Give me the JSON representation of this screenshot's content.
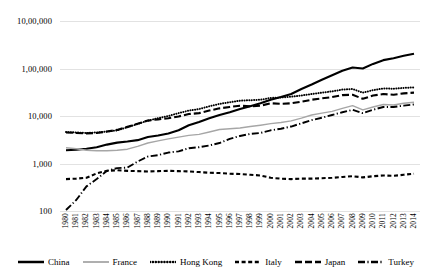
{
  "chart_data": {
    "type": "line",
    "title": "",
    "xlabel": "",
    "ylabel": "",
    "yscale": "log",
    "ylim": [
      100,
      1000000
    ],
    "grid": true,
    "legend_position": "bottom",
    "ytick_labels": [
      "100",
      "1,000",
      "10,000",
      "1,00,000",
      "10,00,000"
    ],
    "ytick_values": [
      100,
      1000,
      10000,
      100000,
      1000000
    ],
    "categories": [
      "1980",
      "1981",
      "1982",
      "1983",
      "1984",
      "1985",
      "1986",
      "1987",
      "1988",
      "1989",
      "1990",
      "1991",
      "1992",
      "1993",
      "1994",
      "1995",
      "1996",
      "1997",
      "1998",
      "1999",
      "2000",
      "2001",
      "2002",
      "2003",
      "2004",
      "2005",
      "2006",
      "2007",
      "2008",
      "2009",
      "2010",
      "2011",
      "2012",
      "2013",
      "2014"
    ],
    "series": [
      {
        "name": "China",
        "style": "solid",
        "color": "#000000",
        "width": 2.1,
        "values": [
          1900,
          1950,
          2050,
          2200,
          2500,
          2750,
          2900,
          3100,
          3600,
          3900,
          4300,
          5000,
          6400,
          7500,
          9000,
          10500,
          12000,
          14000,
          16000,
          18500,
          22000,
          25000,
          29000,
          37000,
          46000,
          58000,
          72000,
          90000,
          105000,
          100000,
          125000,
          150000,
          165000,
          185000,
          205000
        ]
      },
      {
        "name": "France",
        "style": "solid",
        "color": "#a6a6a6",
        "width": 1.4,
        "values": [
          2150,
          2050,
          1900,
          1850,
          1850,
          1900,
          2000,
          2300,
          2700,
          3000,
          3300,
          3600,
          3900,
          4100,
          4600,
          5200,
          5400,
          5600,
          6000,
          6400,
          6900,
          7300,
          7900,
          9000,
          10500,
          11500,
          12500,
          14500,
          16500,
          13500,
          15500,
          17500,
          17000,
          18500,
          19500
        ]
      },
      {
        "name": "Hong Kong",
        "style": "dotted",
        "color": "#000000",
        "width": 2.0,
        "values": [
          4600,
          4500,
          4400,
          4500,
          4700,
          5000,
          5800,
          6800,
          8000,
          9000,
          10000,
          11500,
          13000,
          14000,
          16000,
          18000,
          19500,
          21000,
          21500,
          22000,
          24000,
          24500,
          25500,
          27000,
          29000,
          31000,
          33000,
          36000,
          37000,
          31000,
          35000,
          38000,
          37500,
          39000,
          40000
        ]
      },
      {
        "name": "Italy",
        "style": "dashed-short",
        "color": "#000000",
        "width": 2.1,
        "values": [
          470,
          480,
          500,
          620,
          700,
          720,
          700,
          690,
          680,
          690,
          700,
          690,
          680,
          660,
          640,
          630,
          610,
          600,
          580,
          560,
          500,
          480,
          470,
          480,
          480,
          490,
          500,
          520,
          540,
          510,
          540,
          560,
          550,
          580,
          610
        ]
      },
      {
        "name": "Japan",
        "style": "dashed-long",
        "color": "#000000",
        "width": 2.1,
        "values": [
          4500,
          4400,
          4300,
          4400,
          4700,
          5100,
          5900,
          6900,
          8000,
          8500,
          9000,
          9800,
          11000,
          11500,
          13000,
          14500,
          15500,
          16500,
          16000,
          16500,
          18500,
          18000,
          18500,
          20000,
          22000,
          23500,
          25000,
          27500,
          28000,
          23000,
          27000,
          29000,
          28000,
          30000,
          31000
        ]
      },
      {
        "name": "Turkey",
        "style": "dash-dot",
        "color": "#000000",
        "width": 1.9,
        "values": [
          105,
          170,
          330,
          470,
          700,
          800,
          820,
          1100,
          1400,
          1500,
          1700,
          1800,
          2100,
          2200,
          2400,
          2700,
          3300,
          3800,
          4200,
          4400,
          5000,
          5400,
          6000,
          7000,
          8200,
          9200,
          10500,
          12000,
          13500,
          11500,
          13500,
          15500,
          15500,
          16500,
          17500
        ]
      }
    ]
  },
  "legend": {
    "items": [
      {
        "label": "China"
      },
      {
        "label": "France"
      },
      {
        "label": "Hong Kong"
      },
      {
        "label": "Italy"
      },
      {
        "label": "Japan"
      },
      {
        "label": "Turkey"
      }
    ]
  }
}
